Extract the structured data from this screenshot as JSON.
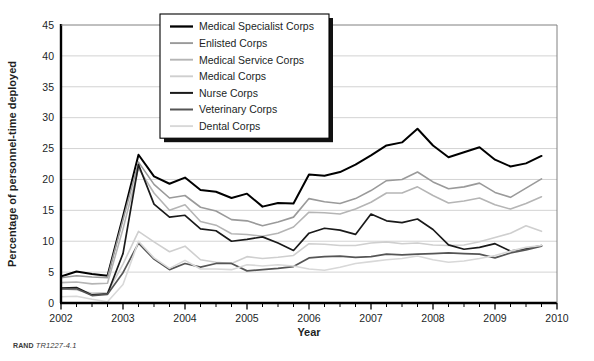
{
  "figure": {
    "credit_prefix": "RAND",
    "credit_id": "TR1227-4.1"
  },
  "chart_data": {
    "type": "line",
    "title": "",
    "xlabel": "Year",
    "ylabel": "Percentage of personnel-time deployed",
    "xlim": [
      2002,
      2010
    ],
    "ylim": [
      0,
      45
    ],
    "ytick_values": [
      0,
      5,
      10,
      15,
      20,
      25,
      30,
      35,
      40,
      45
    ],
    "ytick_labels": [
      "0",
      "5",
      "10",
      "15",
      "20",
      "25",
      "30",
      "35",
      "40",
      "45"
    ],
    "xtick_values": [
      2002,
      2003,
      2004,
      2005,
      2006,
      2007,
      2008,
      2009,
      2010
    ],
    "xtick_labels": [
      "2002",
      "2003",
      "2004",
      "2005",
      "2006",
      "2007",
      "2008",
      "2009",
      "2010"
    ],
    "minor_xticks_per_year": 4,
    "grid": "horizontal",
    "legend_position": "top-center",
    "x": [
      2002.0,
      2002.25,
      2002.5,
      2002.75,
      2003.0,
      2003.25,
      2003.5,
      2003.75,
      2004.0,
      2004.25,
      2004.5,
      2004.75,
      2005.0,
      2005.25,
      2005.5,
      2005.75,
      2006.0,
      2006.25,
      2006.5,
      2006.75,
      2007.0,
      2007.25,
      2007.5,
      2007.75,
      2008.0,
      2008.25,
      2008.5,
      2008.75,
      2009.0,
      2009.25,
      2009.5,
      2009.75
    ],
    "series": [
      {
        "name": "Medical Specialist Corps",
        "color": "#000000",
        "width": 2.0,
        "values": [
          4.3,
          5.1,
          4.7,
          4.4,
          14.0,
          24.0,
          20.5,
          19.3,
          20.3,
          18.3,
          18.0,
          17.0,
          17.7,
          15.6,
          16.2,
          16.1,
          20.8,
          20.6,
          21.2,
          22.4,
          23.9,
          25.5,
          26.0,
          28.2,
          25.5,
          23.6,
          24.4,
          25.2,
          23.2,
          22.1,
          22.6,
          23.8
        ]
      },
      {
        "name": "Enlisted Corps",
        "color": "#9a9a9a",
        "width": 1.6,
        "values": [
          4.1,
          4.4,
          4.2,
          4.1,
          13.5,
          22.8,
          19.2,
          17.0,
          17.4,
          15.5,
          14.9,
          13.5,
          13.3,
          12.5,
          13.1,
          13.9,
          16.9,
          16.4,
          16.1,
          16.9,
          18.2,
          19.8,
          20.0,
          21.2,
          19.6,
          18.5,
          18.8,
          19.4,
          17.9,
          17.1,
          18.6,
          20.1
        ]
      },
      {
        "name": "Medical Service Corps",
        "color": "#b5b5b5",
        "width": 1.6,
        "values": [
          3.3,
          3.4,
          3.1,
          3.2,
          12.0,
          21.8,
          17.8,
          15.0,
          15.9,
          13.2,
          12.6,
          11.2,
          11.1,
          10.8,
          11.3,
          12.3,
          14.7,
          14.6,
          14.4,
          15.2,
          16.3,
          17.8,
          17.8,
          18.8,
          17.4,
          16.2,
          16.5,
          17.0,
          15.9,
          15.2,
          16.1,
          17.2
        ]
      },
      {
        "name": "Medical Corps",
        "color": "#cfcfcf",
        "width": 1.6,
        "values": [
          2.3,
          2.1,
          1.6,
          1.7,
          6.3,
          11.6,
          9.9,
          8.3,
          9.2,
          7.0,
          6.6,
          6.4,
          7.5,
          7.2,
          7.4,
          7.7,
          9.6,
          9.5,
          9.3,
          9.3,
          9.7,
          9.9,
          9.6,
          9.7,
          9.4,
          9.3,
          9.4,
          9.9,
          10.6,
          11.3,
          12.5,
          11.6
        ]
      },
      {
        "name": "Nurse Corps",
        "color": "#1a1a1a",
        "width": 1.7,
        "values": [
          2.4,
          2.5,
          1.3,
          1.5,
          8.0,
          22.4,
          16.0,
          13.9,
          14.2,
          12.0,
          11.7,
          10.0,
          10.3,
          10.7,
          9.7,
          8.5,
          11.3,
          12.1,
          11.8,
          11.1,
          14.4,
          13.3,
          13.0,
          13.6,
          11.9,
          9.4,
          8.7,
          9.0,
          9.6,
          8.4,
          8.8,
          9.3
        ]
      },
      {
        "name": "Veterinary Corps",
        "color": "#555555",
        "width": 1.7,
        "values": [
          2.3,
          2.3,
          1.2,
          1.4,
          4.9,
          9.7,
          7.1,
          5.4,
          6.4,
          5.8,
          6.4,
          6.4,
          5.2,
          5.4,
          5.6,
          5.9,
          7.3,
          7.5,
          7.6,
          7.4,
          7.5,
          7.9,
          7.8,
          7.9,
          8.0,
          8.1,
          8.0,
          7.9,
          7.3,
          8.1,
          8.6,
          9.2
        ]
      },
      {
        "name": "Dental Corps",
        "color": "#d8d8d8",
        "width": 1.6,
        "values": [
          1.0,
          1.1,
          0.6,
          0.2,
          3.0,
          10.0,
          7.3,
          5.6,
          6.9,
          5.5,
          5.5,
          5.4,
          6.2,
          6.0,
          6.2,
          6.0,
          5.5,
          5.3,
          5.8,
          6.4,
          6.7,
          7.0,
          7.2,
          7.6,
          7.0,
          6.6,
          6.8,
          7.2,
          7.7,
          8.4,
          9.0,
          9.3
        ]
      }
    ]
  }
}
